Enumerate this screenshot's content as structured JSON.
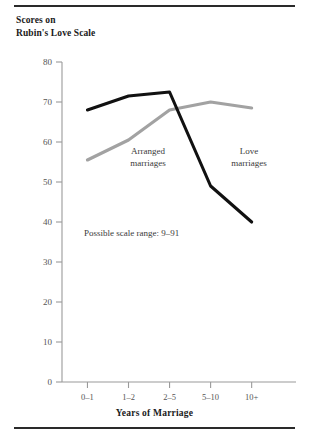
{
  "figure": {
    "title_line1": "Scores on",
    "title_line2": "Rubin's Love Scale",
    "note": "Possible scale range: 9–91",
    "rule_color": "#2a2a2a"
  },
  "chart_data": {
    "type": "line",
    "title": "Scores on Rubin's Love Scale",
    "subtitle": "",
    "xlabel": "Years of Marriage",
    "ylabel": "Scores on Rubin's Love Scale",
    "categories": [
      "0–1",
      "1–2",
      "2–5",
      "5–10",
      "10+"
    ],
    "series": [
      {
        "name": "Love marriages",
        "color": "#111111",
        "values": [
          68,
          71.5,
          72.5,
          49,
          40
        ]
      },
      {
        "name": "Arranged marriages",
        "color": "#a2a2a2",
        "values": [
          55.5,
          60.5,
          68,
          70,
          68.5
        ]
      }
    ],
    "ylim": [
      0,
      80
    ],
    "yticks": [
      0,
      10,
      20,
      30,
      40,
      50,
      60,
      70,
      80
    ],
    "ytick_labels": [
      "0",
      "10",
      "20",
      "30",
      "40",
      "50",
      "60",
      "70",
      "80"
    ],
    "grid": false,
    "legend": "inline-annotations",
    "annotations": [
      {
        "text": "Arranged\nmarriages",
        "series": "Arranged marriages"
      },
      {
        "text": "Love\nmarriages",
        "series": "Love marriages"
      },
      {
        "text": "Possible scale range: 9–91",
        "series": null
      }
    ]
  },
  "axes": {
    "y": {
      "labels": [
        "80",
        "70",
        "60",
        "50",
        "40",
        "30",
        "20",
        "10",
        "0"
      ]
    },
    "x": {
      "title": "Years of Marriage",
      "labels": [
        "0–1",
        "1–2",
        "2–5",
        "5–10",
        "10+"
      ]
    }
  },
  "labels": {
    "arranged_line1": "Arranged",
    "arranged_line2": "marriages",
    "love_line1": "Love",
    "love_line2": "marriages"
  }
}
